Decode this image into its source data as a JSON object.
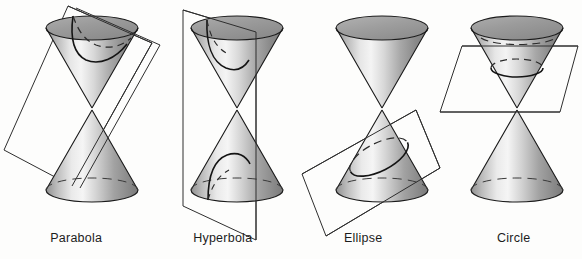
{
  "figure": {
    "background_color": "#fdfdfc",
    "outline_color": "#1a1a1a",
    "plane_color": "#333333",
    "cone_light": "#f2f2f2",
    "cone_mid": "#b8b8b8",
    "cone_dark": "#6e6e6e",
    "top_ellipse_fill": "#9a9a9a",
    "label_color": "#1c1c1c"
  },
  "panels": [
    {
      "id": "parabola",
      "label": "Parabola",
      "plane_orientation": "oblique-parallel-to-slant-side",
      "curve_type": "open single-branch curve on upper nappe",
      "intersects_nappes": 1
    },
    {
      "id": "hyperbola",
      "label": "Hyperbola",
      "plane_orientation": "vertical, parallel to cone axis",
      "curve_type": "two opposing open branches, one per nappe",
      "intersects_nappes": 2
    },
    {
      "id": "ellipse",
      "label": "Ellipse",
      "plane_orientation": "tilted oblique cut across one nappe",
      "curve_type": "closed oval",
      "intersects_nappes": 1
    },
    {
      "id": "circle",
      "label": "Circle",
      "plane_orientation": "horizontal, perpendicular to cone axis",
      "curve_type": "closed circle",
      "intersects_nappes": 1
    }
  ],
  "captions": {
    "parabola": "Parabola",
    "hyperbola": "Hyperbola",
    "ellipse": "Ellipse",
    "circle": "Circle"
  }
}
